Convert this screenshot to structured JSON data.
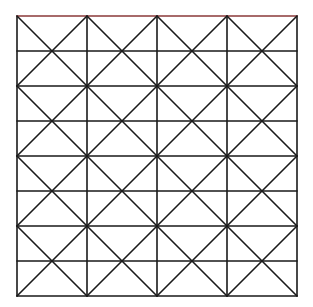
{
  "diagram": {
    "type": "grid-pattern",
    "columns": 4,
    "rows": 4,
    "origin": [
      17,
      16
    ],
    "cell_size": [
      70,
      70
    ],
    "line_color": "#1a1a1a",
    "top_border_color": "#8b3a3a",
    "stroke_width": 1.6
  }
}
